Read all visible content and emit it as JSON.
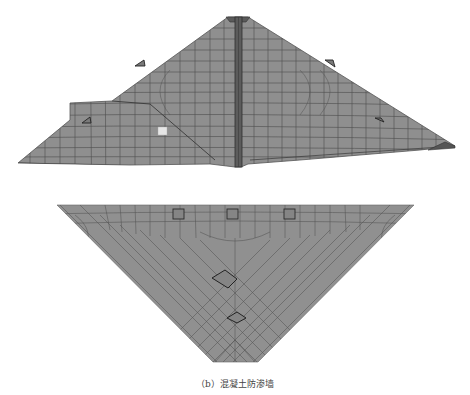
{
  "figures": [
    {
      "id": "a",
      "caption": "（a）坝体剖面（X=250m）",
      "description": "Finite element mesh of dam cross-section with central concrete cutoff wall"
    },
    {
      "id": "b",
      "caption": "（b）混凝土防渗墙",
      "description": "Finite element mesh of concrete cutoff wall face"
    }
  ],
  "colors": {
    "mesh_fill": "#8f8f8f",
    "mesh_line": "#4a4a4a",
    "wall_fill": "#5a5a5a",
    "highlight": "#e6e6e6",
    "element_outline": "#2a2a2a"
  }
}
